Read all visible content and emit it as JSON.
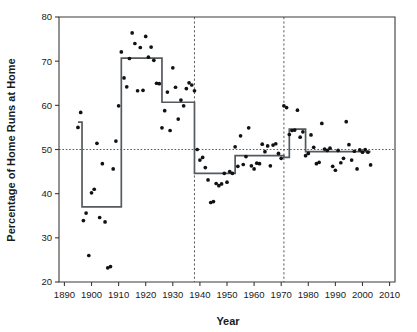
{
  "chart_data": {
    "type": "scatter",
    "title": "",
    "xlabel": "Year",
    "ylabel": "Percentage of Home Runs at Home",
    "xlim": [
      1888,
      2012
    ],
    "ylim": [
      20,
      80
    ],
    "grid": false,
    "legend": null,
    "xticks": [
      1890,
      1900,
      1910,
      1920,
      1930,
      1940,
      1950,
      1960,
      1970,
      1980,
      1990,
      2000,
      2010
    ],
    "yticks": [
      20,
      30,
      40,
      50,
      60,
      70,
      80
    ],
    "reference_lines": {
      "horizontal": [
        {
          "y": 50,
          "style": "dotted"
        }
      ],
      "vertical": [
        {
          "x": 1938,
          "style": "dashed"
        },
        {
          "x": 1971,
          "style": "dashed"
        }
      ]
    },
    "series": [
      {
        "name": "Percentage of home runs hit at home",
        "type": "scatter",
        "marker": "filled-circle",
        "color": "#111111",
        "x": [
          1895,
          1896,
          1897,
          1898,
          1899,
          1900,
          1901,
          1902,
          1903,
          1904,
          1905,
          1906,
          1907,
          1908,
          1909,
          1910,
          1911,
          1912,
          1913,
          1914,
          1915,
          1916,
          1917,
          1918,
          1919,
          1920,
          1921,
          1922,
          1923,
          1924,
          1925,
          1926,
          1927,
          1928,
          1929,
          1930,
          1931,
          1932,
          1933,
          1934,
          1935,
          1936,
          1937,
          1938,
          1939,
          1940,
          1941,
          1942,
          1943,
          1944,
          1945,
          1946,
          1947,
          1948,
          1949,
          1950,
          1951,
          1952,
          1953,
          1954,
          1955,
          1956,
          1957,
          1958,
          1959,
          1960,
          1961,
          1962,
          1963,
          1964,
          1965,
          1966,
          1967,
          1968,
          1969,
          1970,
          1971,
          1972,
          1973,
          1974,
          1975,
          1976,
          1977,
          1978,
          1979,
          1980,
          1981,
          1982,
          1983,
          1984,
          1985,
          1986,
          1987,
          1988,
          1989,
          1990,
          1991,
          1992,
          1993,
          1994,
          1995,
          1996,
          1997,
          1998,
          1999,
          2000,
          2001,
          2002,
          2003
        ],
        "y": [
          55.0,
          58.4,
          33.9,
          35.6,
          26.0,
          40.2,
          41.0,
          51.4,
          34.6,
          46.8,
          33.6,
          23.2,
          23.5,
          45.6,
          51.9,
          59.9,
          72.1,
          66.2,
          64.2,
          70.6,
          76.4,
          74.0,
          63.3,
          73.1,
          63.4,
          75.6,
          70.9,
          73.2,
          70.2,
          65.0,
          64.9,
          54.9,
          58.8,
          63.0,
          54.3,
          68.5,
          64.1,
          56.9,
          61.2,
          59.9,
          63.8,
          65.1,
          64.6,
          63.3,
          50.0,
          47.6,
          48.2,
          45.9,
          43.1,
          38.0,
          38.2,
          42.3,
          41.8,
          42.2,
          44.6,
          42.6,
          45.0,
          44.6,
          50.6,
          46.2,
          53.1,
          46.6,
          48.4,
          54.9,
          46.3,
          45.6,
          46.9,
          46.8,
          51.2,
          49.5,
          50.8,
          46.3,
          51.0,
          51.3,
          49.1,
          48.0,
          59.9,
          59.5,
          53.4,
          54.3,
          54.4,
          58.9,
          52.8,
          54.0,
          48.6,
          49.1,
          53.3,
          50.5,
          46.8,
          47.1,
          55.9,
          50.1,
          49.8,
          50.3,
          46.2,
          45.3,
          49.8,
          47.0,
          48.0,
          56.3,
          51.1,
          47.6,
          49.6,
          45.6,
          49.9,
          49.4,
          50.0,
          49.4,
          46.5
        ]
      },
      {
        "name": "Fitted step function (change-point means)",
        "type": "step",
        "color": "#555a5e",
        "segments": [
          {
            "x_start": 1895,
            "x_end": 1896.5,
            "level": 56.2
          },
          {
            "x_start": 1896.5,
            "x_end": 1911,
            "level": 37.0
          },
          {
            "x_start": 1911,
            "x_end": 1926,
            "level": 70.7
          },
          {
            "x_start": 1926,
            "x_end": 1938,
            "level": 60.7
          },
          {
            "x_start": 1938,
            "x_end": 1953,
            "level": 44.6
          },
          {
            "x_start": 1953,
            "x_end": 1971,
            "level": 48.6
          },
          {
            "x_start": 1971,
            "x_end": 1973,
            "level": 48.2
          },
          {
            "x_start": 1973,
            "x_end": 1979,
            "level": 54.6
          },
          {
            "x_start": 1979,
            "x_end": 2003,
            "level": 49.5
          }
        ]
      }
    ]
  }
}
